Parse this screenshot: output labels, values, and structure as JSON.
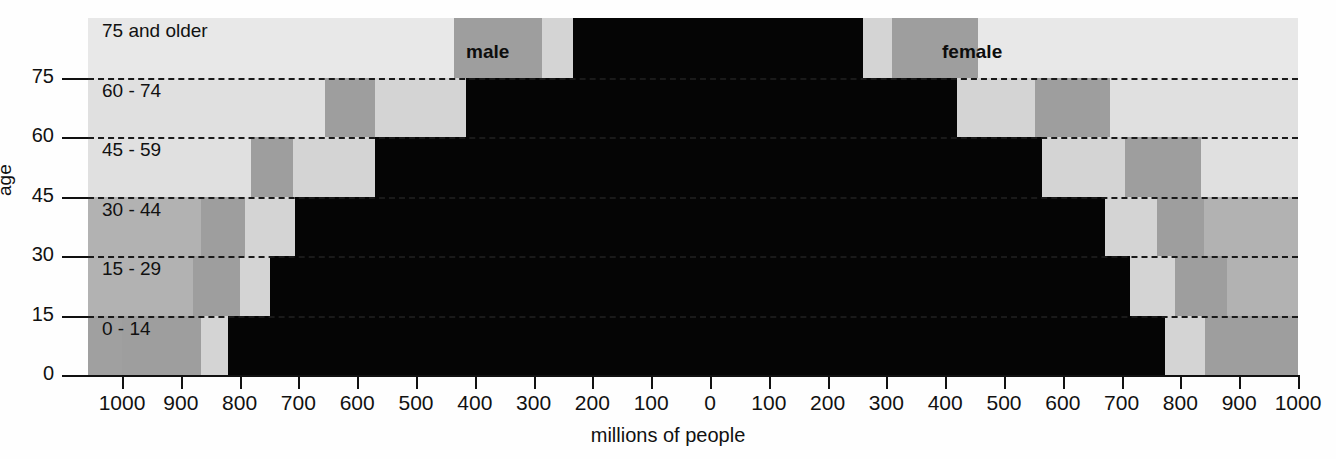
{
  "chart_data": {
    "type": "bar",
    "title": "",
    "subtitle": "",
    "xlabel": "millions of people",
    "ylabel": "age",
    "orientation": "horizontal-pyramid",
    "grid": true,
    "legend_position": "in-plot",
    "xlim": [
      -1000,
      1000
    ],
    "ylim": [
      0,
      90
    ],
    "xticks": [
      1000,
      900,
      800,
      700,
      600,
      500,
      400,
      300,
      200,
      100,
      0,
      100,
      200,
      300,
      400,
      500,
      600,
      700,
      800,
      900,
      1000
    ],
    "xtick_labels": [
      "1000",
      "900",
      "800",
      "700",
      "600",
      "500",
      "400",
      "300",
      "200",
      "100",
      "0",
      "100",
      "200",
      "300",
      "400",
      "500",
      "600",
      "700",
      "800",
      "900",
      "1000"
    ],
    "yticks": [
      0,
      15,
      30,
      45,
      60,
      75
    ],
    "ytick_labels": [
      "0",
      "15",
      "30",
      "45",
      "60",
      "75"
    ],
    "units": "millions",
    "categories": [
      "0 - 14",
      "15 - 29",
      "30 - 44",
      "45 - 59",
      "60 - 74",
      "75 and older"
    ],
    "series": [
      {
        "name": "male",
        "values": [
          820,
          748,
          705,
          570,
          415,
          233
        ]
      },
      {
        "name": "female",
        "values": [
          774,
          714,
          672,
          565,
          420,
          260
        ]
      }
    ],
    "annotations": [
      "male",
      "female"
    ]
  },
  "axes": {
    "y_axis_title": "age",
    "x_axis_title": "millions of people",
    "y_ticks": [
      {
        "label": "0",
        "value": 0
      },
      {
        "label": "15",
        "value": 15
      },
      {
        "label": "30",
        "value": 30
      },
      {
        "label": "45",
        "value": 45
      },
      {
        "label": "60",
        "value": 60
      },
      {
        "label": "75",
        "value": 75
      }
    ],
    "x_ticks": [
      {
        "label": "1000",
        "value": -1000
      },
      {
        "label": "900",
        "value": -900
      },
      {
        "label": "800",
        "value": -800
      },
      {
        "label": "700",
        "value": -700
      },
      {
        "label": "600",
        "value": -600
      },
      {
        "label": "500",
        "value": -500
      },
      {
        "label": "400",
        "value": -400
      },
      {
        "label": "300",
        "value": -300
      },
      {
        "label": "200",
        "value": -200
      },
      {
        "label": "100",
        "value": -100
      },
      {
        "label": "0",
        "value": 0
      },
      {
        "label": "100",
        "value": 100
      },
      {
        "label": "200",
        "value": 200
      },
      {
        "label": "300",
        "value": 300
      },
      {
        "label": "400",
        "value": 400
      },
      {
        "label": "500",
        "value": 500
      },
      {
        "label": "600",
        "value": 600
      },
      {
        "label": "700",
        "value": 700
      },
      {
        "label": "800",
        "value": 800
      },
      {
        "label": "900",
        "value": 900
      },
      {
        "label": "1000",
        "value": 1000
      }
    ]
  },
  "bands": [
    {
      "caption": "0 - 14",
      "y0": 0,
      "y1": 15,
      "bg": "#a0a0a0",
      "male": {
        "black": 820,
        "light": 865,
        "dark": 1000
      },
      "female": {
        "black": 774,
        "light": 842,
        "dark": 1000
      }
    },
    {
      "caption": "15 - 29",
      "y0": 15,
      "y1": 30,
      "bg": "#b2b2b2",
      "male": {
        "black": 748,
        "light": 800,
        "dark": 880
      },
      "female": {
        "black": 714,
        "light": 790,
        "dark": 880
      }
    },
    {
      "caption": "30 - 44",
      "y0": 30,
      "y1": 45,
      "bg": "#b2b2b2",
      "male": {
        "black": 705,
        "light": 790,
        "dark": 865
      },
      "female": {
        "black": 672,
        "light": 760,
        "dark": 840
      }
    },
    {
      "caption": "45 - 59",
      "y0": 45,
      "y1": 60,
      "bg": "#e0e0e0",
      "male": {
        "black": 570,
        "light": 710,
        "dark": 780
      },
      "female": {
        "black": 565,
        "light": 705,
        "dark": 835
      }
    },
    {
      "caption": "60 - 74",
      "y0": 60,
      "y1": 75,
      "bg": "#e0e0e0",
      "male": {
        "black": 415,
        "light": 570,
        "dark": 655
      },
      "female": {
        "black": 420,
        "light": 553,
        "dark": 680
      }
    },
    {
      "caption": "75 and older",
      "y0": 75,
      "y1": 90,
      "bg": "#e8e8e8",
      "male": {
        "black": 233,
        "light": 285,
        "dark": 435
      },
      "female": {
        "black": 260,
        "light": 310,
        "dark": 455
      }
    }
  ],
  "annotations": {
    "male_label": "male",
    "female_label": "female"
  },
  "colors": {
    "black_segment": "#050505",
    "light_segment": "#d4d4d4",
    "dark_segment": "#9e9e9e",
    "axis": "#111111",
    "band_bg_top": "#e8e8e8",
    "band_bg_bottom": "#a0a0a0"
  }
}
